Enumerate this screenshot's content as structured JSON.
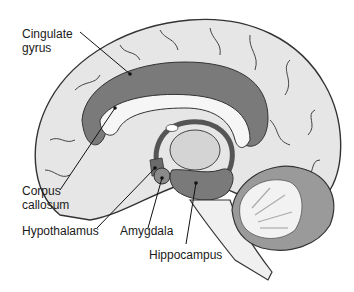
{
  "diagram": {
    "labels": {
      "cingulate_gyrus_1": "Cingulate",
      "cingulate_gyrus_2": "gyrus",
      "corpus_callosum_1": "Corpus",
      "corpus_callosum_2": "callosum",
      "hypothalamus": "Hypothalamus",
      "amygdala": "Amygdala",
      "hippocampus": "Hippocampus"
    },
    "colors": {
      "cortex": "#e6e6e6",
      "limbic_dark": "#7a7a7a",
      "white_matter": "#f4f4f4",
      "outline": "#333333",
      "text": "#1a1a1a"
    }
  }
}
